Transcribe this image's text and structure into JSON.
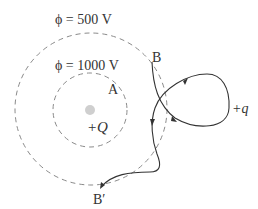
{
  "diagram": {
    "outer_equipotential": {
      "label": "ϕ = 500 V",
      "center": [
        91,
        109
      ],
      "radius": 76
    },
    "inner_equipotential": {
      "label": "ϕ = 1000 V",
      "center": [
        90,
        110
      ],
      "radius": 37
    },
    "source_charge": {
      "label": "+Q",
      "color": "#c8c8c8"
    },
    "test_charge": {
      "label": "+q"
    },
    "points": {
      "A": "A",
      "B": "B",
      "B_prime": "B′"
    },
    "colors": {
      "dashed_circle": "#888888",
      "path": "#333333",
      "text": "#333333"
    }
  }
}
